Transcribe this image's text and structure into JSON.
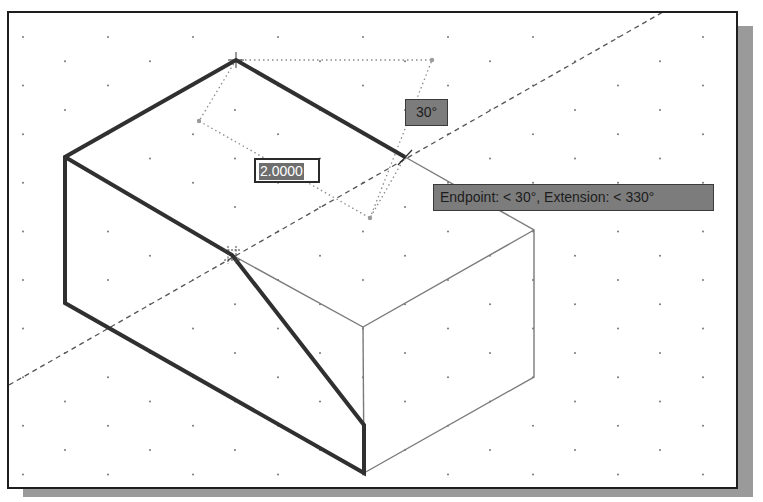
{
  "viewport": {
    "background": "#ffffff",
    "grid": {
      "type": "isometric-dots",
      "color": "#777777"
    }
  },
  "drawing": {
    "object": "isometric block with sloped cut",
    "thick_edge_color": "#303030",
    "thin_edge_color": "#7a7a7a",
    "construction_line": "dashed 30° tracking line"
  },
  "dynamic_input": {
    "value": "2.0000",
    "selected": true
  },
  "angle_tooltip": {
    "text": "30°"
  },
  "osnap_tooltip": {
    "text": "Endpoint: < 30°,  Extension: < 330°"
  },
  "icons": {
    "cursor": "crosshair-cursor-icon",
    "snap_marker": "extension-snap-marker-icon",
    "intersection": "tracking-intersection-icon"
  }
}
